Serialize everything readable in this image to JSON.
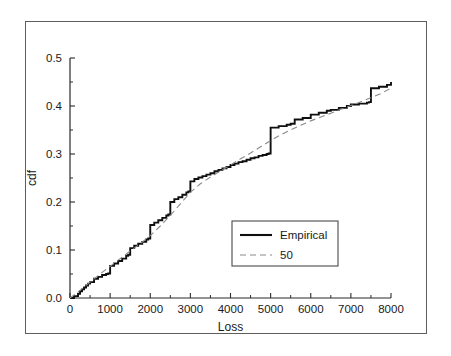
{
  "figure": {
    "background_color": "#ffffff",
    "frame_color": "#5d5d5d",
    "axis_color": "#2b2b2b"
  },
  "chart_data": {
    "type": "line",
    "title": "",
    "subtitle": "",
    "xlabel": "Loss",
    "ylabel": "cdf",
    "xlim": [
      0,
      8000
    ],
    "ylim": [
      0.0,
      0.5
    ],
    "grid": false,
    "legend_position": "center-right-inside",
    "xticks": [
      0,
      1000,
      2000,
      3000,
      4000,
      5000,
      6000,
      7000,
      8000
    ],
    "xtick_labels": [
      "0",
      "1000",
      "2000",
      "3000",
      "4000",
      "5000",
      "6000",
      "7000",
      "8000"
    ],
    "xtick_minor": [
      500,
      1500,
      2500,
      3500,
      4500,
      5500,
      6500,
      7500
    ],
    "yticks": [
      0.0,
      0.1,
      0.2,
      0.3,
      0.4,
      0.5
    ],
    "ytick_labels": [
      "0.0",
      "0.1",
      "0.2",
      "0.3",
      "0.4",
      "0.5"
    ],
    "ytick_minor": [
      0.05,
      0.15,
      0.25,
      0.35,
      0.45
    ],
    "series": [
      {
        "name": "Empirical",
        "style": "step-solid",
        "color": "#0f0f0f",
        "x": [
          0,
          100,
          200,
          250,
          300,
          350,
          400,
          450,
          500,
          600,
          700,
          800,
          900,
          950,
          1000,
          1100,
          1200,
          1300,
          1400,
          1450,
          1500,
          1600,
          1700,
          1800,
          1900,
          1950,
          2000,
          2100,
          2200,
          2300,
          2400,
          2450,
          2500,
          2600,
          2700,
          2800,
          2900,
          2950,
          3000,
          3100,
          3200,
          3300,
          3400,
          3500,
          3600,
          3700,
          3800,
          3900,
          4000,
          4100,
          4200,
          4300,
          4400,
          4500,
          4600,
          4700,
          4800,
          4900,
          4950,
          5000,
          5200,
          5400,
          5500,
          5600,
          5800,
          6000,
          6200,
          6400,
          6500,
          6700,
          6900,
          7000,
          7200,
          7400,
          7450,
          7500,
          7700,
          7900,
          8000
        ],
        "y": [
          0.0,
          0.004,
          0.009,
          0.014,
          0.018,
          0.022,
          0.026,
          0.03,
          0.033,
          0.04,
          0.044,
          0.048,
          0.05,
          0.051,
          0.067,
          0.072,
          0.077,
          0.082,
          0.088,
          0.09,
          0.104,
          0.109,
          0.113,
          0.117,
          0.122,
          0.124,
          0.152,
          0.157,
          0.162,
          0.167,
          0.172,
          0.174,
          0.2,
          0.206,
          0.21,
          0.215,
          0.22,
          0.222,
          0.243,
          0.248,
          0.251,
          0.254,
          0.257,
          0.26,
          0.264,
          0.267,
          0.27,
          0.273,
          0.277,
          0.28,
          0.283,
          0.285,
          0.288,
          0.291,
          0.293,
          0.296,
          0.298,
          0.3,
          0.301,
          0.355,
          0.358,
          0.361,
          0.363,
          0.372,
          0.375,
          0.382,
          0.386,
          0.39,
          0.392,
          0.396,
          0.4,
          0.403,
          0.405,
          0.407,
          0.408,
          0.437,
          0.44,
          0.444,
          0.45
        ],
        "final_value": 0.45
      },
      {
        "name": "50",
        "style": "dashed-smooth",
        "color": "#8a8a8a",
        "x": [
          0,
          250,
          500,
          750,
          1000,
          1250,
          1500,
          1750,
          2000,
          2250,
          2500,
          2750,
          3000,
          3250,
          3500,
          3750,
          4000,
          4250,
          4500,
          4750,
          5000,
          5250,
          5500,
          5750,
          6000,
          6250,
          6500,
          6750,
          7000,
          7250,
          7500,
          7750,
          8000
        ],
        "y": [
          0.0,
          0.016,
          0.033,
          0.05,
          0.066,
          0.082,
          0.098,
          0.113,
          0.13,
          0.15,
          0.172,
          0.196,
          0.22,
          0.238,
          0.252,
          0.265,
          0.277,
          0.29,
          0.302,
          0.315,
          0.328,
          0.34,
          0.35,
          0.36,
          0.369,
          0.377,
          0.385,
          0.393,
          0.401,
          0.409,
          0.417,
          0.426,
          0.437
        ]
      }
    ],
    "legend": [
      {
        "label": "Empirical",
        "style": "solid",
        "color": "#0f0f0f"
      },
      {
        "label": "50",
        "style": "dashed",
        "color": "#8a8a8a"
      }
    ]
  }
}
